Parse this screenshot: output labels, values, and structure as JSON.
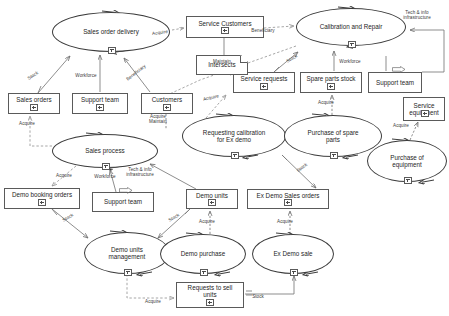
{
  "diagram": {
    "style": {
      "node_stroke": "#5a5a5a",
      "process_stroke": "#3c3c3c",
      "edge_stroke": "#7a7a7a",
      "text_color": "#1e1e1e",
      "background": "#ffffff"
    },
    "processes": [
      {
        "id": "sales-order-delivery",
        "label": "Sales order delivery",
        "x": 52,
        "y": 12,
        "w": 118,
        "h": 40,
        "marker": "+"
      },
      {
        "id": "calibration-and-repair",
        "label": "Calibration and Repair",
        "x": 296,
        "y": 8,
        "w": 110,
        "h": 38,
        "marker": "+"
      },
      {
        "id": "sales-process",
        "label": "Sales process",
        "x": 52,
        "y": 134,
        "w": 106,
        "h": 34,
        "marker": "+"
      },
      {
        "id": "requesting-calibration",
        "label": "Requesting calibration\nfor Ex demo",
        "x": 182,
        "y": 115,
        "w": 104,
        "h": 42,
        "marker": "+"
      },
      {
        "id": "purchase-of-spare-parts",
        "label": "Purchase of spare\nparts",
        "x": 284,
        "y": 115,
        "w": 98,
        "h": 42,
        "marker": "+"
      },
      {
        "id": "purchase-of-equipment",
        "label": "Purchase of\nequipment",
        "x": 367,
        "y": 140,
        "w": 80,
        "h": 42,
        "marker": "+"
      },
      {
        "id": "demo-units-management",
        "label": "Demo units\nmanagement",
        "x": 84,
        "y": 232,
        "w": 86,
        "h": 42,
        "marker": "+"
      },
      {
        "id": "demo-purchase",
        "label": "Demo purchase",
        "x": 160,
        "y": 234,
        "w": 86,
        "h": 40,
        "marker": "+"
      },
      {
        "id": "ex-demo-sale",
        "label": "Ex Demo sale",
        "x": 252,
        "y": 234,
        "w": 82,
        "h": 40,
        "marker": "+"
      }
    ],
    "objects": [
      {
        "id": "service-customers",
        "label": "Service Customers",
        "x": 186,
        "y": 16,
        "w": 78,
        "h": 22,
        "marker": "+"
      },
      {
        "id": "sales-orders",
        "label": "Sales orders",
        "x": 8,
        "y": 93,
        "w": 52,
        "h": 21,
        "marker": "+"
      },
      {
        "id": "support-team-sales",
        "label": "Support team",
        "x": 72,
        "y": 93,
        "w": 56,
        "h": 21,
        "marker": "+"
      },
      {
        "id": "customers",
        "label": "Customers",
        "x": 141,
        "y": 93,
        "w": 52,
        "h": 21,
        "marker": "+"
      },
      {
        "id": "service-requests",
        "label": "Service requests",
        "x": 233,
        "y": 72,
        "w": 62,
        "h": 21,
        "marker": "+"
      },
      {
        "id": "spare-parts-stock",
        "label": "Spare parts stock",
        "x": 300,
        "y": 72,
        "w": 62,
        "h": 21,
        "marker": "+"
      },
      {
        "id": "support-team-service",
        "label": "Support team",
        "x": 368,
        "y": 72,
        "w": 54,
        "h": 21,
        "marker": "none"
      },
      {
        "id": "service-equipment",
        "label": "Service\nequipment",
        "x": 403,
        "y": 97,
        "w": 42,
        "h": 24,
        "marker": "+"
      },
      {
        "id": "demo-booking-orders",
        "label": "Demo booking orders",
        "x": 4,
        "y": 188,
        "w": 76,
        "h": 21,
        "marker": "+"
      },
      {
        "id": "support-team-demo",
        "label": "Support team",
        "x": 92,
        "y": 192,
        "w": 62,
        "h": 20,
        "marker": "none"
      },
      {
        "id": "demo-units",
        "label": "Demo units",
        "x": 186,
        "y": 189,
        "w": 52,
        "h": 20,
        "marker": "+"
      },
      {
        "id": "ex-demo-sales-orders",
        "label": "Ex Demo Sales orders",
        "x": 247,
        "y": 189,
        "w": 82,
        "h": 20,
        "marker": "+"
      },
      {
        "id": "requests-to-sell",
        "label": "Requests to sell\nunits",
        "x": 176,
        "y": 282,
        "w": 68,
        "h": 26,
        "marker": "+"
      }
    ],
    "notes": [
      {
        "id": "intersects",
        "label": "Intersects",
        "x": 196,
        "y": 55,
        "w": 52,
        "h": 20
      }
    ],
    "arrow_glyphs": [
      {
        "id": "tech-info-glyph-service",
        "x": 392,
        "y": 59
      },
      {
        "id": "tech-info-glyph-demo",
        "x": 119,
        "y": 180
      }
    ],
    "edges": [
      {
        "id": "sales-orders-to-delivery",
        "label": "Stock",
        "lx": 33,
        "ly": 76,
        "rot": -33
      },
      {
        "id": "support-team-to-delivery",
        "label": "Workforce",
        "lx": 81,
        "ly": 75,
        "rot": 0
      },
      {
        "id": "customers-to-delivery",
        "label": "Beneficiary",
        "lx": 133,
        "ly": 73,
        "rot": -38
      },
      {
        "id": "delivery-to-service-customers",
        "label": "Acquire",
        "lx": 156,
        "ly": 33,
        "rot": -8
      },
      {
        "id": "service-customers-to-calibration",
        "label": "Beneficiary",
        "lx": 258,
        "ly": 31,
        "rot": 0
      },
      {
        "id": "tech-info-to-calibration",
        "label": "Tech & info\ninfrastructure",
        "lx": 396,
        "ly": 13,
        "rot": 0
      },
      {
        "id": "service-requests-to-calibration",
        "label": "Stock",
        "lx": 291,
        "ly": 59,
        "rot": -30
      },
      {
        "id": "spare-parts-to-calibration",
        "label": "Workforce",
        "lx": 349,
        "ly": 62,
        "rot": 0
      },
      {
        "id": "intersects-to-service-requests",
        "label": "Maintain",
        "lx": 220,
        "ly": 62,
        "rot": 0
      },
      {
        "id": "requesting-to-service-requests",
        "label": "Acquire",
        "lx": 210,
        "ly": 98,
        "rot": -12
      },
      {
        "id": "purchase-spare-to-stock",
        "label": "Acquire",
        "lx": 325,
        "ly": 103,
        "rot": 0
      },
      {
        "id": "purchase-equipment-to-service-eq",
        "label": "Acquire",
        "lx": 400,
        "ly": 126,
        "rot": 0
      },
      {
        "id": "sales-process-to-sales-orders",
        "label": "Acquire",
        "lx": 26,
        "ly": 124,
        "rot": 0
      },
      {
        "id": "customers-to-sales-process",
        "label": "Acquire\nMaintain",
        "lx": 155,
        "ly": 117,
        "rot": 0
      },
      {
        "id": "sales-process-to-demo-booking",
        "label": "Acquire",
        "lx": 63,
        "ly": 176,
        "rot": 0
      },
      {
        "id": "support-team-to-sales-process",
        "label": "Workforce",
        "lx": 104,
        "ly": 177,
        "rot": 0
      },
      {
        "id": "demo-units-to-sales-process",
        "label": "Tech & info\ninfrastructure",
        "lx": 138,
        "ly": 170,
        "rot": 0
      },
      {
        "id": "demo-booking-to-demo-units-mgmt",
        "label": "Stock",
        "lx": 67,
        "ly": 218,
        "rot": -30
      },
      {
        "id": "demo-units-to-demo-units-mgmt",
        "label": "Stock",
        "lx": 173,
        "ly": 218,
        "rot": -30
      },
      {
        "id": "demo-purchase-to-demo-units",
        "label": "Acquire",
        "lx": 206,
        "ly": 222,
        "rot": 0
      },
      {
        "id": "ex-demo-sale-to-sales-orders-obj",
        "label": "Acquire",
        "lx": 284,
        "ly": 222,
        "rot": 0
      },
      {
        "id": "requesting-to-ex-demo-sales-orders",
        "label": "Stock",
        "lx": 300,
        "ly": 168,
        "rot": -38
      },
      {
        "id": "demo-units-mgmt-to-requests",
        "label": "Acquire",
        "lx": 152,
        "ly": 302,
        "rot": 0
      },
      {
        "id": "requests-to-ex-demo-sale",
        "label": "Stock",
        "lx": 257,
        "ly": 297,
        "rot": 0
      }
    ]
  }
}
